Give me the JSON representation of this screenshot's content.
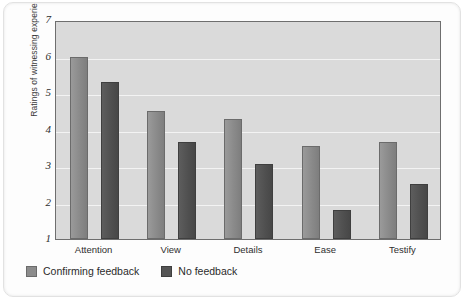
{
  "chart_data": {
    "type": "bar",
    "title": "",
    "xlabel": "",
    "ylabel": "Ratings of witnessing experience",
    "categories": [
      "Attention",
      "View",
      "Details",
      "Ease",
      "Testify"
    ],
    "ylim": [
      1,
      7
    ],
    "yticks": [
      7,
      6,
      5,
      4,
      3,
      2,
      1
    ],
    "grid": true,
    "legend_position": "bottom-left",
    "series": [
      {
        "name": "Confirming feedback",
        "color": "#8c8c8c",
        "values": [
          6.0,
          4.5,
          4.3,
          3.55,
          3.65
        ]
      },
      {
        "name": "No feedback",
        "color": "#555555",
        "values": [
          5.3,
          3.65,
          3.05,
          1.8,
          2.5
        ]
      }
    ]
  }
}
